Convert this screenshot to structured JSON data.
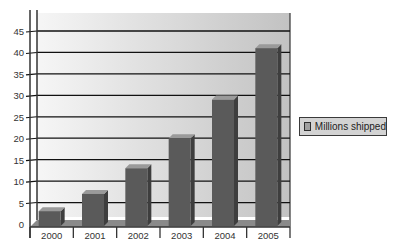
{
  "chart_data": {
    "type": "bar",
    "title": "",
    "xlabel": "",
    "ylabel": "",
    "categories": [
      "2000",
      "2001",
      "2002",
      "2003",
      "2004",
      "2005"
    ],
    "series": [
      {
        "name": "Millions shipped",
        "values": [
          3,
          7,
          13,
          20,
          29,
          41
        ]
      }
    ],
    "ylim": [
      0,
      45
    ],
    "yticks": [
      0,
      5,
      10,
      15,
      20,
      25,
      30,
      35,
      40,
      45
    ],
    "grid": true,
    "style": "3d",
    "legend_position": "right"
  },
  "legend": {
    "label": "Millions shipped"
  },
  "colors": {
    "bar_front": "#5a5a5a",
    "bar_top": "#9a9a9a",
    "bar_side": "#3e3e3e",
    "floor": "#8a8a8a",
    "wall_light": "#f4f4f4",
    "wall_dark": "#c4c4c4",
    "gridline": "#111111",
    "axis": "#333333"
  }
}
